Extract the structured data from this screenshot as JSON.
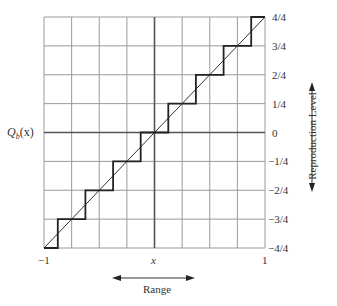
{
  "chart_data": {
    "type": "line",
    "title": "",
    "xlabel": "x",
    "ylabel": "Q_b(x)",
    "xlim": [
      -1,
      1
    ],
    "ylim": [
      -1,
      1
    ],
    "grid": true,
    "x_ticks": [
      "-1",
      "x",
      "1"
    ],
    "y_ticks": [
      "4/4",
      "3/4",
      "2/4",
      "1/4",
      "0",
      "-1/4",
      "-2/4",
      "-3/4",
      "-4/4"
    ],
    "series": [
      {
        "name": "identity",
        "style": "thin diagonal line",
        "x": [
          -1,
          1
        ],
        "y": [
          -1,
          1
        ]
      },
      {
        "name": "Q_b(x) staircase quantizer",
        "style": "thick step line",
        "x": [
          -1,
          -0.875,
          -0.875,
          -0.625,
          -0.625,
          -0.375,
          -0.375,
          -0.125,
          -0.125,
          0.125,
          0.125,
          0.375,
          0.375,
          0.625,
          0.625,
          0.875,
          0.875,
          1
        ],
        "y": [
          -1,
          -1,
          -0.75,
          -0.75,
          -0.5,
          -0.5,
          -0.25,
          -0.25,
          0,
          0,
          0.25,
          0.25,
          0.5,
          0.5,
          0.75,
          0.75,
          1,
          1
        ]
      }
    ],
    "annotations": [
      {
        "text": "Range",
        "type": "horizontal double arrow below x-axis"
      },
      {
        "text": "Reproduction Level",
        "type": "vertical double arrow right of y-ticks"
      }
    ]
  },
  "labels": {
    "q_main": "Q",
    "q_sub": "b",
    "q_arg": "(x)",
    "x_left": "−1",
    "x_mid": "x",
    "x_right": "1",
    "range": "Range",
    "reproduction_level": "Reproduction Level",
    "y_ticks": [
      "4/4",
      "3/4",
      "2/4",
      "1/4",
      "0",
      "−1/4",
      "−2/4",
      "−3/4",
      "−4/4"
    ]
  },
  "colors": {
    "grid": "#9a9a9a",
    "axis": "#555555",
    "step": "#222222",
    "diagonal": "#333333"
  }
}
